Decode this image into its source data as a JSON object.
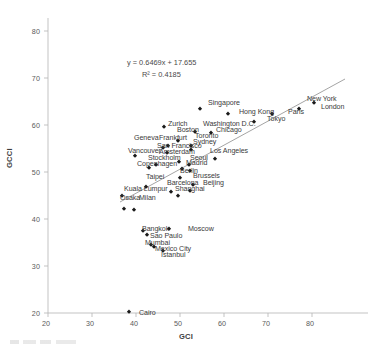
{
  "chart_data": {
    "type": "scatter",
    "title": "",
    "xlabel": "GCI",
    "ylabel": "GCCI",
    "xlim": [
      20,
      85
    ],
    "ylim": [
      20,
      84
    ],
    "xticks": [
      20,
      30,
      40,
      50,
      60,
      70,
      80
    ],
    "yticks": [
      20,
      30,
      40,
      50,
      60,
      70,
      80
    ],
    "grid": false,
    "legend": false,
    "trendline": {
      "equation": "y = 0.6469x + 17.655",
      "r_squared": "R² = 0.4185",
      "slope": 0.6469,
      "intercept": 17.655,
      "x_start": 36.5,
      "x_end": 80.0
    },
    "points": [
      {
        "label": "New York",
        "x": 80.5,
        "y": 64.6
      },
      {
        "label": "London",
        "x": 77.0,
        "y": 63.5
      },
      {
        "label": "Singapore",
        "x": 54.5,
        "y": 63.3
      },
      {
        "label": "Hong Kong",
        "x": 61.0,
        "y": 62.3
      },
      {
        "label": "Paris",
        "x": 71.0,
        "y": 62.3
      },
      {
        "label": "Tokyo",
        "x": 66.8,
        "y": 60.7
      },
      {
        "label": "Zurich",
        "x": 46.3,
        "y": 59.6
      },
      {
        "label": "Washington D.C.",
        "x": 53.3,
        "y": 58.6
      },
      {
        "label": "Chicago",
        "x": 57.0,
        "y": 58.2
      },
      {
        "label": "Boston",
        "x": 49.5,
        "y": 56.7
      },
      {
        "label": "Toronto",
        "x": 52.5,
        "y": 55.6
      },
      {
        "label": "Frankfurt",
        "x": 47.3,
        "y": 55.6
      },
      {
        "label": "Geneva",
        "x": 46.2,
        "y": 55.2
      },
      {
        "label": "Sydney",
        "x": 52.4,
        "y": 54.6
      },
      {
        "label": "San Francisco",
        "x": 47.1,
        "y": 54.1
      },
      {
        "label": "Vancouver",
        "x": 39.7,
        "y": 53.3
      },
      {
        "label": "Los Angeles",
        "x": 58.0,
        "y": 52.7
      },
      {
        "label": "Amsterdam",
        "x": 49.8,
        "y": 52.2
      },
      {
        "label": "Seoul",
        "x": 52.0,
        "y": 51.5
      },
      {
        "label": "Stockholm",
        "x": 44.5,
        "y": 51.4
      },
      {
        "label": "Madrid",
        "x": 52.3,
        "y": 50.3
      },
      {
        "label": "Copenhagen",
        "x": 50.5,
        "y": 50.6
      },
      {
        "label": "Osaka-alt",
        "x": 43.0,
        "y": 50.8
      },
      {
        "label": "Berlin",
        "x": 50.0,
        "y": 48.8
      },
      {
        "label": "Brussels",
        "x": 53.0,
        "y": 47.2
      },
      {
        "label": "Taipei",
        "x": 42.2,
        "y": 46.8
      },
      {
        "label": "Barcelona",
        "x": 48.0,
        "y": 45.8
      },
      {
        "label": "Beijing",
        "x": 52.3,
        "y": 45.9
      },
      {
        "label": "Shanghai",
        "x": 49.5,
        "y": 45.0
      },
      {
        "label": "Kuala Lumpur",
        "x": 36.8,
        "y": 44.9
      },
      {
        "label": "Osaka",
        "x": 37.3,
        "y": 42.2
      },
      {
        "label": "Milan",
        "x": 39.5,
        "y": 42.0
      },
      {
        "label": "Bangkok",
        "x": 41.5,
        "y": 37.5
      },
      {
        "label": "Moscow",
        "x": 47.5,
        "y": 37.8
      },
      {
        "label": "Sao Paulo",
        "x": 42.6,
        "y": 36.5
      },
      {
        "label": "Mumbai",
        "x": 43.4,
        "y": 34.4
      },
      {
        "label": "Mexico City",
        "x": 44.1,
        "y": 34.0
      },
      {
        "label": "Istanbul",
        "x": 46.2,
        "y": 33.1
      },
      {
        "label": "Cairo",
        "x": 38.3,
        "y": 20.2
      }
    ]
  },
  "labels": {
    "visible": [
      {
        "text": "New York",
        "x": 307,
        "y": 96
      },
      {
        "text": "London",
        "x": 321,
        "y": 104
      },
      {
        "text": "Singapore",
        "x": 208,
        "y": 100
      },
      {
        "text": "Hong Kong",
        "x": 239,
        "y": 109
      },
      {
        "text": "Paris",
        "x": 288,
        "y": 109
      },
      {
        "text": "Tokyo",
        "x": 267,
        "y": 116
      },
      {
        "text": "Zurich",
        "x": 168,
        "y": 121
      },
      {
        "text": "Washington D.C.",
        "x": 203,
        "y": 121
      },
      {
        "text": "Chicago",
        "x": 216,
        "y": 127
      },
      {
        "text": "Boston",
        "x": 177,
        "y": 127
      },
      {
        "text": "Toronto",
        "x": 195,
        "y": 133
      },
      {
        "text": "Frankfurt",
        "x": 159,
        "y": 135
      },
      {
        "text": "Geneva",
        "x": 134,
        "y": 135
      },
      {
        "text": "Sydney",
        "x": 193,
        "y": 139
      },
      {
        "text": "San Francisco",
        "x": 157,
        "y": 143
      },
      {
        "text": "Vancouver",
        "x": 128,
        "y": 148
      },
      {
        "text": "Los Angeles",
        "x": 210,
        "y": 148
      },
      {
        "text": "Amsterdam",
        "x": 159,
        "y": 149
      },
      {
        "text": "Seoul",
        "x": 190,
        "y": 155
      },
      {
        "text": "Stockholm",
        "x": 148,
        "y": 155
      },
      {
        "text": "Madrid",
        "x": 186,
        "y": 160
      },
      {
        "text": "Copenhagen",
        "x": 137,
        "y": 161
      },
      {
        "text": "Berlin",
        "x": 180,
        "y": 168
      },
      {
        "text": "Brussels",
        "x": 193,
        "y": 173
      },
      {
        "text": "Taipei",
        "x": 146,
        "y": 174
      },
      {
        "text": "Barcelona",
        "x": 167,
        "y": 180
      },
      {
        "text": "Beijing",
        "x": 203,
        "y": 180
      },
      {
        "text": "Shanghai",
        "x": 175,
        "y": 186
      },
      {
        "text": "Kuala Lumpur",
        "x": 124,
        "y": 186
      },
      {
        "text": "Osaka",
        "x": 120,
        "y": 195
      },
      {
        "text": "Milan",
        "x": 139,
        "y": 195
      },
      {
        "text": "Bangkok",
        "x": 142,
        "y": 226
      },
      {
        "text": "Moscow",
        "x": 188,
        "y": 226
      },
      {
        "text": "Sao Paulo",
        "x": 150,
        "y": 233
      },
      {
        "text": "Mumbai",
        "x": 145,
        "y": 240
      },
      {
        "text": "Mexico City",
        "x": 155,
        "y": 246
      },
      {
        "text": "Istanbul",
        "x": 161,
        "y": 252
      },
      {
        "text": "Cairo",
        "x": 139,
        "y": 310
      }
    ]
  },
  "axes": {
    "x_title": "GCI",
    "y_title": "GCCI",
    "x_ticks": [
      "20",
      "30",
      "40",
      "50",
      "60",
      "70",
      "80"
    ],
    "y_ticks": [
      "20",
      "30",
      "40",
      "50",
      "60",
      "70",
      "80"
    ]
  },
  "annotations": {
    "equation": "y = 0.6469x + 17.655",
    "r_squared": "R² = 0.4185"
  },
  "colors": {
    "marker": "#1a1a1a",
    "axis": "#b0b0b0",
    "trendline": "#8a8a8a",
    "text": "#3a3a3a"
  }
}
